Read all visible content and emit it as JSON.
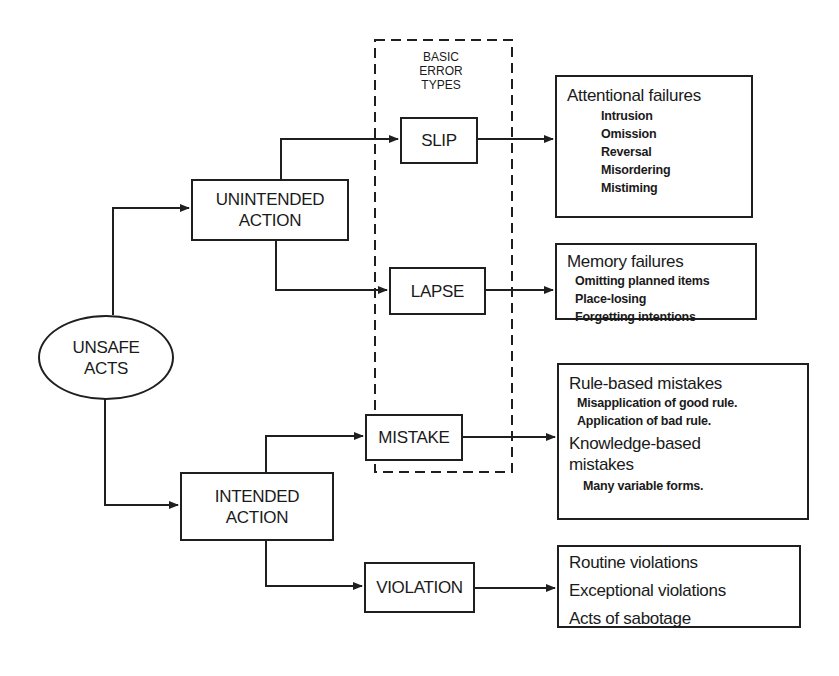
{
  "diagram": {
    "root": {
      "label_line1": "UNSAFE",
      "label_line2": "ACTS"
    },
    "branches": {
      "unintended": {
        "label_line1": "UNINTENDED",
        "label_line2": "ACTION"
      },
      "intended": {
        "label_line1": "INTENDED",
        "label_line2": "ACTION"
      }
    },
    "basic_error_types": {
      "header_line1": "BASIC",
      "header_line2": "ERROR",
      "header_line3": "TYPES",
      "slip": "SLIP",
      "lapse": "LAPSE",
      "mistake": "MISTAKE"
    },
    "violation": "VIOLATION",
    "outcomes": {
      "attentional": {
        "title": "Attentional failures",
        "items": [
          "Intrusion",
          "Omission",
          "Reversal",
          "Misordering",
          "Mistiming"
        ]
      },
      "memory": {
        "title": "Memory failures",
        "items": [
          "Omitting planned items",
          "Place-losing",
          "Forgetting intentions"
        ]
      },
      "mistakes": {
        "rule_title": "Rule-based mistakes",
        "rule_items": [
          "Misapplication of good rule.",
          "Application of bad rule."
        ],
        "knowledge_title_line1": "Knowledge-based",
        "knowledge_title_line2": "mistakes",
        "knowledge_items": [
          "Many variable forms."
        ]
      },
      "violations": {
        "items": [
          "Routine violations",
          "Exceptional violations",
          "Acts of sabotage"
        ]
      }
    }
  }
}
